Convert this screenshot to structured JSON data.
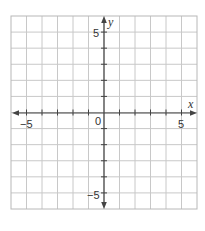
{
  "diagram": {
    "type": "coordinate-plane",
    "x_axis": {
      "label": "x",
      "min": -6,
      "max": 6,
      "tick_step": 1,
      "labeled_ticks": [
        {
          "value": -5,
          "text": "−5"
        },
        {
          "value": 5,
          "text": "5"
        }
      ]
    },
    "y_axis": {
      "label": "y",
      "min": -6,
      "max": 6,
      "tick_step": 1,
      "labeled_ticks": [
        {
          "value": 5,
          "text": "5"
        },
        {
          "value": -5,
          "text": "−5"
        }
      ]
    },
    "origin_label": "0",
    "grid": {
      "columns": 12,
      "rows": 12,
      "line_color": "#c8c8c8",
      "border_color": "#b8b8b8"
    },
    "axis_color": "#444444",
    "background": "#ffffff"
  },
  "labels": {
    "x_axis_name": "x",
    "y_axis_name": "y",
    "origin": "0",
    "x_neg5": "−5",
    "x_pos5": "5",
    "y_pos5": "5",
    "y_neg5": "−5"
  }
}
